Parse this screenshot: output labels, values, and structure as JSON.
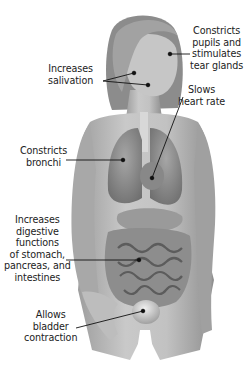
{
  "figure": {
    "labels": [
      {
        "id": "eyes",
        "text": "Constricts\npupils and\nstimulates\ntear glands",
        "target": "eye",
        "dot": [
          170,
          54
        ]
      },
      {
        "id": "salivation",
        "text": "Increases\nsalivation",
        "target": "salivary glands",
        "dots": [
          [
            134,
            73
          ],
          [
            148,
            85
          ]
        ]
      },
      {
        "id": "heart",
        "text": "Slows\nheart rate",
        "target": "heart",
        "dot": [
          152,
          178
        ]
      },
      {
        "id": "bronchi",
        "text": "Constricts\nbronchi",
        "target": "lungs",
        "dot": [
          123,
          160
        ]
      },
      {
        "id": "digestive",
        "text": "Increases\ndigestive\nfunctions\nof stomach,\npancreas, and\nintestines",
        "target": "intestines",
        "dot": [
          139,
          260
        ]
      },
      {
        "id": "bladder",
        "text": "Allows\nbladder\ncontraction",
        "target": "bladder",
        "dot": [
          143,
          311
        ]
      }
    ],
    "colors": {
      "background": "#ffffff",
      "skin": "#b8b8b8",
      "skin_dark": "#8a8a8a",
      "hair": "#9a9a9a",
      "organ": "#7c7c7c",
      "leader_line": "#111111",
      "text": "#222222"
    }
  }
}
